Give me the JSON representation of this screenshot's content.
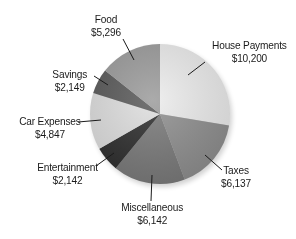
{
  "chart_data": {
    "type": "pie",
    "title": "",
    "start_angle_deg": 0,
    "direction": "clockwise",
    "categories": [
      "House Payments",
      "Taxes",
      "Miscellaneous",
      "Entertainment",
      "Car Expenses",
      "Savings",
      "Food"
    ],
    "values": [
      10200,
      6137,
      6142,
      2142,
      4847,
      2149,
      5296
    ],
    "value_labels": [
      "$10,200",
      "$6,137",
      "$6,142",
      "$2,142",
      "$4,847",
      "$2,149",
      "$5,296"
    ],
    "colors": [
      "#ececec",
      "#8f8f8f",
      "#7a7a7a",
      "#2e2e2e",
      "#dedede",
      "#5a5a5a",
      "#9c9c9c"
    ],
    "legend": "none",
    "labels_position": "outside with leader lines"
  },
  "labels": [
    {
      "name": "House Payments",
      "value": "$10,200",
      "x": 207,
      "y": 39,
      "lx1": 205,
      "ly1": 62,
      "lx2": 188,
      "ly2": 75
    },
    {
      "name": "Taxes",
      "value": "$6,137",
      "x": 219,
      "y": 164,
      "lx1": 222,
      "ly1": 170,
      "lx2": 205,
      "ly2": 155
    },
    {
      "name": "Miscellaneous",
      "value": "$6,142",
      "x": 117,
      "y": 201,
      "lx1": 151,
      "ly1": 201,
      "lx2": 152,
      "ly2": 175
    },
    {
      "name": "Entertainment",
      "value": "$2,142",
      "x": 33,
      "y": 161,
      "lx1": 96,
      "ly1": 166,
      "lx2": 114,
      "ly2": 153
    },
    {
      "name": "Car Expenses",
      "value": "$4,847",
      "x": 15,
      "y": 115,
      "lx1": 78,
      "ly1": 122,
      "lx2": 101,
      "ly2": 120
    },
    {
      "name": "Savings",
      "value": "$2,149",
      "x": 50,
      "y": 68,
      "lx1": 94,
      "ly1": 76,
      "lx2": 108,
      "ly2": 85
    },
    {
      "name": "Food",
      "value": "$5,296",
      "x": 89,
      "y": 13,
      "lx1": 123,
      "ly1": 39,
      "lx2": 134,
      "ly2": 60
    }
  ]
}
